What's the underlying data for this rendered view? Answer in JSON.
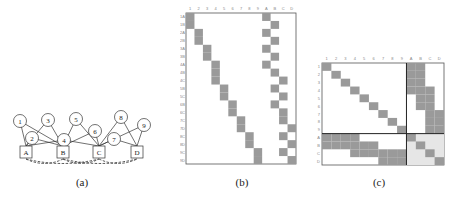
{
  "panels": {
    "a": {
      "caption": "(a)",
      "variable_nodes": [
        "1",
        "2",
        "3",
        "4",
        "5",
        "6",
        "7",
        "8",
        "9"
      ],
      "factor_nodes": [
        "A",
        "B",
        "C",
        "D"
      ],
      "edges": {
        "1": [
          "A",
          "B"
        ],
        "2": [
          "A",
          "B"
        ],
        "3": [
          "A",
          "B"
        ],
        "4": [
          "A",
          "B",
          "C"
        ],
        "5": [
          "B",
          "C"
        ],
        "6": [
          "B",
          "C"
        ],
        "7": [
          "C",
          "D"
        ],
        "8": [
          "C",
          "D"
        ],
        "9": [
          "C",
          "D"
        ]
      },
      "dashed_links": [
        [
          "A",
          "B"
        ],
        [
          "A",
          "C"
        ],
        [
          "B",
          "C"
        ],
        [
          "B",
          "D"
        ],
        [
          "C",
          "D"
        ]
      ]
    },
    "b": {
      "caption": "(b)",
      "column_labels": [
        "1",
        "2",
        "3",
        "4",
        "5",
        "6",
        "7",
        "8",
        "9",
        "A",
        "B",
        "C",
        "D"
      ]
    },
    "c": {
      "caption": "(c)",
      "column_labels": [
        "1",
        "2",
        "3",
        "4",
        "5",
        "6",
        "7",
        "8",
        "9",
        "A",
        "B",
        "C",
        "D"
      ],
      "row_labels": [
        "1",
        "2",
        "3",
        "4",
        "5",
        "6",
        "7",
        "8",
        "9",
        "A",
        "B",
        "C",
        "D"
      ]
    }
  },
  "colors": {
    "fill": "#9a9a9a",
    "light_fill": "#e6e6e6",
    "line": "#333333"
  }
}
